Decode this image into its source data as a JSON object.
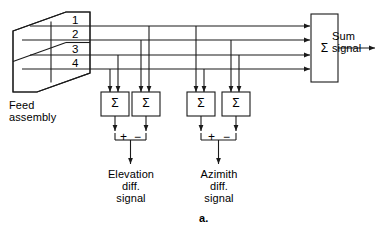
{
  "figure": {
    "panel_label": "a.",
    "type": "block-diagram"
  },
  "feed": {
    "label": "Feed\nassembly",
    "quadrant_labels": [
      "1",
      "2",
      "3",
      "4"
    ],
    "quadrant_count": 4
  },
  "sum": {
    "symbol": "Σ",
    "output_label": "Sum\nsignal"
  },
  "comparators": [
    {
      "id": "elev-left",
      "symbol": "Σ"
    },
    {
      "id": "elev-right",
      "symbol": "Σ"
    },
    {
      "id": "azim-left",
      "symbol": "Σ"
    },
    {
      "id": "azim-right",
      "symbol": "Σ"
    }
  ],
  "elevation": {
    "plus": "+",
    "minus": "−",
    "output_label": "Elevation\ndiff.\nsignal",
    "output_lines": [
      "Elevation",
      "diff.",
      "signal"
    ]
  },
  "azimuth": {
    "plus": "+",
    "minus": "−",
    "output_label": "Azimith\ndiff.\nsignal",
    "output_lines": [
      "Azimith",
      "diff.",
      "signal"
    ]
  },
  "colors": {
    "stroke": "#1a1a1a",
    "text": "#000000",
    "background": "#ffffff"
  }
}
